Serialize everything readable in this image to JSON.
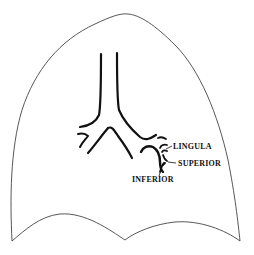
{
  "diagram": {
    "colors": {
      "outline": "#444444",
      "bronchi": "#111111",
      "background": "#ffffff"
    },
    "labels": [
      {
        "id": "lingula",
        "text": "LINGULA"
      },
      {
        "id": "superior",
        "text": "SUPERIOR"
      },
      {
        "id": "inferior",
        "text": "INFERIOR"
      }
    ]
  }
}
